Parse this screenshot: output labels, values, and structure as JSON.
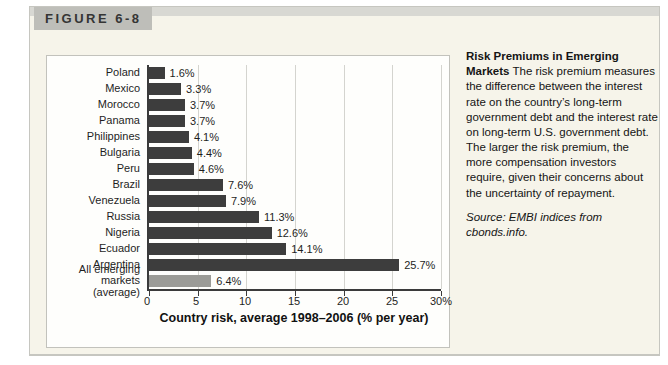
{
  "figure": {
    "label": "FIGURE 6-8"
  },
  "chart_data": {
    "type": "bar",
    "orientation": "horizontal",
    "categories": [
      "Poland",
      "Mexico",
      "Morocco",
      "Panama",
      "Philippines",
      "Bulgaria",
      "Peru",
      "Brazil",
      "Venezuela",
      "Russia",
      "Nigeria",
      "Ecuador",
      "Argentina",
      "All emerging markets (average)"
    ],
    "values": [
      1.6,
      3.3,
      3.7,
      3.7,
      4.1,
      4.4,
      4.6,
      7.6,
      7.9,
      11.3,
      12.6,
      14.1,
      25.7,
      6.4
    ],
    "value_labels": [
      "1.6%",
      "3.3%",
      "3.7%",
      "3.7%",
      "4.1%",
      "4.4%",
      "4.6%",
      "7.6%",
      "7.9%",
      "11.3%",
      "12.6%",
      "14.1%",
      "25.7%",
      "6.4%"
    ],
    "average_index": 13,
    "xlabel": "Country risk, average 1998–2006 (% per year)",
    "xlim": [
      0,
      30
    ],
    "xticks": [
      0,
      5,
      10,
      15,
      20,
      25,
      30
    ],
    "xtick_labels": [
      "0",
      "5",
      "10",
      "15",
      "20",
      "25",
      "30%"
    ],
    "grid": true,
    "legend": "none",
    "bar_color": "#3d3d3d",
    "average_bar_color": "#9b9b97",
    "grid_color": "#d4d4cf",
    "axis_color": "#3b3b3b"
  },
  "caption": {
    "title": "Risk Premiums in Emerging Markets",
    "body": "The risk premium measures the difference between the interest rate on the country’s long-term government debt and the interest rate on long-term U.S. government debt. The larger the risk premium, the more compensation investors require, given their concerns about the uncertainty of repayment.",
    "source": "Source: EMBI indices from cbonds.info."
  },
  "colors": {
    "figure_background": "#f6f4ea",
    "header_band": "#d8d8d3",
    "figure_label_box": "#bebeb9",
    "panel_background": "#fefefc"
  }
}
